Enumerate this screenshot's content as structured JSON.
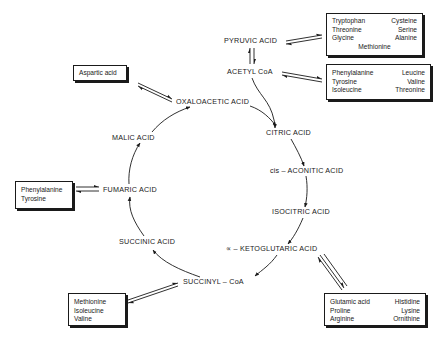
{
  "diagram": {
    "type": "krebs-cycle-amino-acid-entry",
    "nodes": {
      "pyruvic": "PYRUVIC ACID",
      "acetyl_coa": "ACETYL CoA",
      "oxaloacetic": "OXALOACETIC ACID",
      "citric": "CITRIC ACID",
      "cis_aconitic": "cis – ACONITIC ACID",
      "isocitric": "ISOCITRIC ACID",
      "ketoglutaric": "∝ – KETOGLUTARIC ACID",
      "succinyl_coa": "SUCCINYL – CoA",
      "succinic": "SUCCINIC ACID",
      "fumaric": "FUMARIC ACID",
      "malic": "MALIC ACID"
    },
    "boxes": {
      "pyruvic_box": {
        "rows": [
          [
            "Tryptophan",
            "Cysteine"
          ],
          [
            "Threonine",
            "Serine"
          ],
          [
            "Glycine",
            "Alanine"
          ]
        ],
        "footer": "Methionine"
      },
      "acetyl_box": {
        "rows": [
          [
            "Phenylalanine",
            "Leucine"
          ],
          [
            "Tyrosine",
            "Valine"
          ],
          [
            "Isoleucine",
            "Threonine"
          ]
        ]
      },
      "aspartic_box": {
        "items": [
          "Aspartic acid"
        ]
      },
      "fumaric_box": {
        "items": [
          "Phenylalanine",
          "Tyrosine"
        ]
      },
      "succinyl_box": {
        "items": [
          "Methionine",
          "Isoleucine",
          "Valine"
        ]
      },
      "ketoglutaric_box": {
        "rows": [
          [
            "Glutamic acid",
            "Histidine"
          ],
          [
            "Proline",
            "Lysine"
          ],
          [
            "Arginine",
            "Ornithine"
          ]
        ]
      }
    },
    "edges": [
      {
        "from": "pyruvic",
        "to": "acetyl_coa",
        "type": "reversible"
      },
      {
        "from": "acetyl_coa",
        "to": "citric",
        "type": "forward"
      },
      {
        "from": "oxaloacetic",
        "to": "citric",
        "type": "forward"
      },
      {
        "from": "citric",
        "to": "cis_aconitic",
        "type": "forward"
      },
      {
        "from": "cis_aconitic",
        "to": "isocitric",
        "type": "forward"
      },
      {
        "from": "isocitric",
        "to": "ketoglutaric",
        "type": "forward"
      },
      {
        "from": "ketoglutaric",
        "to": "succinyl_coa",
        "type": "forward"
      },
      {
        "from": "succinyl_coa",
        "to": "succinic",
        "type": "forward"
      },
      {
        "from": "succinic",
        "to": "fumaric",
        "type": "forward"
      },
      {
        "from": "fumaric",
        "to": "malic",
        "type": "forward"
      },
      {
        "from": "malic",
        "to": "oxaloacetic",
        "type": "forward"
      },
      {
        "from": "pyruvic_box",
        "to": "pyruvic",
        "type": "reversible"
      },
      {
        "from": "acetyl_box",
        "to": "acetyl_coa",
        "type": "reversible"
      },
      {
        "from": "aspartic_box",
        "to": "oxaloacetic",
        "type": "reversible"
      },
      {
        "from": "fumaric_box",
        "to": "fumaric",
        "type": "reversible"
      },
      {
        "from": "succinyl_box",
        "to": "succinyl_coa",
        "type": "reversible"
      },
      {
        "from": "ketoglutaric_box",
        "to": "ketoglutaric",
        "type": "reversible"
      }
    ]
  }
}
